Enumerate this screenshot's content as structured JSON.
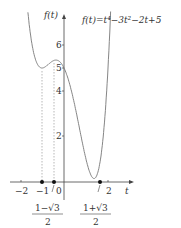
{
  "chart_data": {
    "type": "line",
    "title": "f(t)=t⁴−3t²−2t+5",
    "xlabel": "t",
    "ylabel": "f(t)",
    "xlim": [
      -2.4,
      2.5
    ],
    "ylim": [
      0,
      7.2
    ],
    "x_ticks": [
      "−2",
      "−1",
      "0",
      "2"
    ],
    "y_ticks": [
      "2",
      "4",
      "5",
      "6"
    ],
    "grid": false,
    "series": [
      {
        "name": "f(t)",
        "expression": "t^4-3t^2-2t+5",
        "x": [
          -1.5,
          -1.0,
          -0.5,
          0.0,
          0.5,
          1.0,
          1.366,
          1.5,
          2.0,
          2.2
        ],
        "y": [
          5.3125,
          5.0,
          5.3125,
          5.0,
          3.3125,
          1.0,
          0.536,
          0.3125,
          5.0,
          7.9
        ]
      }
    ],
    "annotations": [
      {
        "text": "−1",
        "x": -1,
        "dotted_line_to": 5.0
      },
      {
        "text": "(1−√3)/2",
        "x": -0.366,
        "dotted_line_to": 5.34
      },
      {
        "text": "(1+√3)/2",
        "x": 1.366
      }
    ],
    "labels": {
      "formula": "f(t)=t⁴−3t²−2t+5",
      "y_axis": "f(t)",
      "x_axis": "t",
      "tick_m2": "−2",
      "tick_m1": "−1",
      "tick_0": "0",
      "tick_2": "2",
      "tick_y2": "2",
      "tick_y4": "4",
      "tick_y5": "5",
      "tick_y6": "6",
      "frac1_num": "1−√3",
      "frac1_den": "2",
      "frac2_num": "1+√3",
      "frac2_den": "2"
    }
  }
}
